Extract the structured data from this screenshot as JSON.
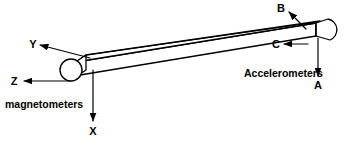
{
  "figure": {
    "background_color": "#ffffff",
    "line_color": "#000000"
  },
  "axes": {
    "x": {
      "label": "X",
      "direction": "down"
    },
    "y": {
      "label": "Y",
      "direction": "up-left"
    },
    "z": {
      "label": "Z",
      "direction": "left"
    }
  },
  "sensors": {
    "magnetometers": {
      "label": "magnetometers",
      "location": "left-end"
    },
    "accelerometers": {
      "label": "Accelerometers",
      "location": "right-end",
      "items": [
        {
          "label": "A",
          "direction": "down"
        },
        {
          "label": "B",
          "direction": "up-left"
        },
        {
          "label": "C",
          "direction": "left"
        }
      ]
    }
  }
}
